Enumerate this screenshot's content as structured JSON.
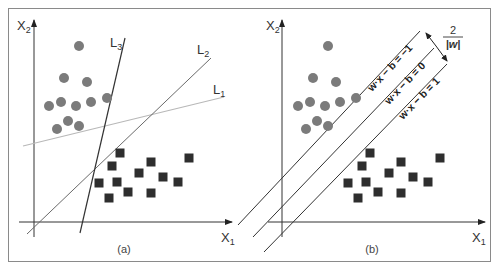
{
  "figure": {
    "frame": {
      "x": 8,
      "y": 8,
      "width": 483,
      "height": 254,
      "color": "#8a8a8a"
    },
    "colors": {
      "axis": "#333333",
      "circle": "#7b7b7b",
      "square": "#2e2e2e",
      "L1": "#b8b8b8",
      "L2": "#6a6a6a",
      "L3": "#333333",
      "margin_lines": "#333333"
    }
  },
  "panel_a": {
    "label": "(a)",
    "x_axis": {
      "label": "X",
      "sub": "1"
    },
    "y_axis": {
      "label": "X",
      "sub": "2"
    },
    "lines": [
      {
        "name": "L",
        "sub": "1",
        "x1": 23,
        "y1": 146,
        "x2": 224,
        "y2": 97,
        "lx": 213,
        "ly": 94
      },
      {
        "name": "L",
        "sub": "2",
        "x1": 27,
        "y1": 234,
        "x2": 211,
        "y2": 58,
        "lx": 198,
        "ly": 53
      },
      {
        "name": "L",
        "sub": "3",
        "x1": 80,
        "y1": 233,
        "x2": 125,
        "y2": 38,
        "lx": 110,
        "ly": 47
      }
    ],
    "circles": [
      [
        79,
        46
      ],
      [
        64,
        78
      ],
      [
        87,
        82
      ],
      [
        49,
        106
      ],
      [
        61,
        102
      ],
      [
        76,
        106
      ],
      [
        91,
        102
      ],
      [
        107,
        98
      ],
      [
        68,
        121
      ],
      [
        79,
        126
      ],
      [
        57,
        129
      ]
    ],
    "squares": [
      [
        120,
        153
      ],
      [
        112,
        166
      ],
      [
        151,
        162
      ],
      [
        189,
        158
      ],
      [
        139,
        173
      ],
      [
        99,
        183
      ],
      [
        117,
        182
      ],
      [
        163,
        177
      ],
      [
        178,
        182
      ],
      [
        109,
        198
      ],
      [
        128,
        192
      ],
      [
        151,
        193
      ]
    ]
  },
  "panel_b": {
    "label": "(b)",
    "x_axis": {
      "label": "X",
      "sub": "1"
    },
    "y_axis": {
      "label": "X",
      "sub": "2"
    },
    "margin_lines": [
      {
        "equation": "w·x − b = −1",
        "x1": 238,
        "y1": 225,
        "x2": 420,
        "y2": 31
      },
      {
        "equation": "w·x − b = 0",
        "x1": 253,
        "y1": 237,
        "x2": 434,
        "y2": 48
      },
      {
        "equation": "w·x − b = 1",
        "x1": 264,
        "y1": 252,
        "x2": 447,
        "y2": 64
      }
    ],
    "margin_width": {
      "numerator": "2",
      "denominator": "|w|"
    },
    "circles": [
      [
        328,
        46
      ],
      [
        313,
        78
      ],
      [
        336,
        82
      ],
      [
        298,
        106
      ],
      [
        310,
        102
      ],
      [
        325,
        106
      ],
      [
        340,
        102
      ],
      [
        356,
        98
      ],
      [
        317,
        121
      ],
      [
        328,
        126
      ],
      [
        306,
        129
      ]
    ],
    "squares": [
      [
        370,
        153
      ],
      [
        362,
        166
      ],
      [
        401,
        162
      ],
      [
        440,
        158
      ],
      [
        389,
        173
      ],
      [
        348,
        183
      ],
      [
        366,
        182
      ],
      [
        413,
        177
      ],
      [
        428,
        182
      ],
      [
        358,
        198
      ],
      [
        378,
        192
      ],
      [
        401,
        193
      ]
    ]
  }
}
